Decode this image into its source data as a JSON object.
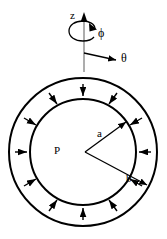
{
  "figure": {
    "type": "engineering-diagram",
    "background_color": "#ffffff",
    "line_color": "#000000",
    "width": 167,
    "height": 239
  },
  "coordinate_system": {
    "name": "cylindrical-coordinate-triad",
    "axes": [
      {
        "id": "z",
        "label": "z",
        "direction": "up",
        "icon": "axis-arrow-up-icon"
      },
      {
        "id": "theta",
        "label": "θ",
        "direction": "right-down",
        "icon": "axis-arrow-right-icon"
      },
      {
        "id": "phi",
        "label": "ϕ",
        "direction": "rotation-about-z",
        "icon": "rotation-arrow-icon"
      }
    ]
  },
  "annulus": {
    "name": "cylinder-cross-section",
    "center": {
      "x": 83,
      "y": 152
    },
    "outer_radius": 75,
    "inner_radius": 53,
    "outer_label": "b",
    "inner_label": "a",
    "stroke_width": 2
  },
  "pressure": {
    "label": "P",
    "direction": "inward",
    "arrow_count": 12,
    "description_icon": "pressure-arrow-icon"
  },
  "dimension_lines": [
    {
      "name": "inner-radius-line",
      "label": "a",
      "from": "center",
      "to": "inner-circle",
      "angle_deg": -35
    },
    {
      "name": "outer-radius-line",
      "label": "b",
      "from": "center",
      "to": "outer-circle",
      "angle_deg": 33
    }
  ],
  "labels": {
    "z": "z",
    "phi": "ϕ",
    "theta": "θ",
    "a": "a",
    "b": "b",
    "P": "P"
  }
}
